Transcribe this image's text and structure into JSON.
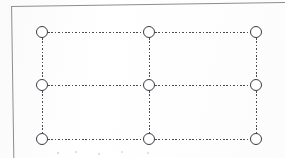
{
  "figure": {
    "kind": "lattice-diagram",
    "background_color": "#ffffff",
    "node_stroke_color": "#3b3b44",
    "node_fill_color": "#ffffff",
    "edge_color": "#4a4a52",
    "frame_color": "#8d8d8f",
    "edge_style": "dashed",
    "node_diameter_px": 12,
    "rows": 3,
    "columns": 3
  },
  "frame": {
    "name": "page-border",
    "top_rule_visible": "true",
    "left_rule_visible": "true",
    "right_rule_visible": "false",
    "bottom_rule_visible": "false",
    "skew_degrees": "-0.85"
  },
  "nodes": [
    {
      "id": "n-r1c1",
      "row": 1,
      "col": 1,
      "x": 42,
      "y": 32,
      "label": ""
    },
    {
      "id": "n-r1c2",
      "row": 1,
      "col": 2,
      "x": 149,
      "y": 32,
      "label": ""
    },
    {
      "id": "n-r1c3",
      "row": 1,
      "col": 3,
      "x": 256,
      "y": 32,
      "label": ""
    },
    {
      "id": "n-r2c1",
      "row": 2,
      "col": 1,
      "x": 42,
      "y": 85,
      "label": ""
    },
    {
      "id": "n-r2c2",
      "row": 2,
      "col": 2,
      "x": 149,
      "y": 85,
      "label": ""
    },
    {
      "id": "n-r2c3",
      "row": 2,
      "col": 3,
      "x": 256,
      "y": 85,
      "label": ""
    },
    {
      "id": "n-r3c1",
      "row": 3,
      "col": 1,
      "x": 42,
      "y": 139,
      "label": ""
    },
    {
      "id": "n-r3c2",
      "row": 3,
      "col": 2,
      "x": 149,
      "y": 139,
      "label": ""
    },
    {
      "id": "n-r3c3",
      "row": 3,
      "col": 3,
      "x": 256,
      "y": 139,
      "label": ""
    }
  ],
  "edges": [
    {
      "id": "e-r1c1-r1c2",
      "orientation": "horizontal",
      "from": "n-r1c1",
      "to": "n-r1c2",
      "x": 48,
      "y": 32,
      "length": 95
    },
    {
      "id": "e-r1c2-r1c3",
      "orientation": "horizontal",
      "from": "n-r1c2",
      "to": "n-r1c3",
      "x": 155,
      "y": 32,
      "length": 95
    },
    {
      "id": "e-r2c1-r2c2",
      "orientation": "horizontal",
      "from": "n-r2c1",
      "to": "n-r2c2",
      "x": 48,
      "y": 85,
      "length": 95
    },
    {
      "id": "e-r2c2-r2c3",
      "orientation": "horizontal",
      "from": "n-r2c2",
      "to": "n-r2c3",
      "x": 155,
      "y": 85,
      "length": 95
    },
    {
      "id": "e-r3c1-r3c2",
      "orientation": "horizontal",
      "from": "n-r3c1",
      "to": "n-r3c2",
      "x": 48,
      "y": 139,
      "length": 95
    },
    {
      "id": "e-r3c2-r3c3",
      "orientation": "horizontal",
      "from": "n-r3c2",
      "to": "n-r3c3",
      "x": 155,
      "y": 139,
      "length": 95
    },
    {
      "id": "e-r1c1-r2c1",
      "orientation": "vertical",
      "from": "n-r1c1",
      "to": "n-r2c1",
      "x": 42,
      "y": 38,
      "length": 41
    },
    {
      "id": "e-r2c1-r3c1",
      "orientation": "vertical",
      "from": "n-r2c1",
      "to": "n-r3c1",
      "x": 42,
      "y": 91,
      "length": 42
    },
    {
      "id": "e-r1c2-r2c2",
      "orientation": "vertical",
      "from": "n-r1c2",
      "to": "n-r2c2",
      "x": 149,
      "y": 38,
      "length": 41
    },
    {
      "id": "e-r2c2-r3c2",
      "orientation": "vertical",
      "from": "n-r2c2",
      "to": "n-r3c2",
      "x": 149,
      "y": 91,
      "length": 42
    },
    {
      "id": "e-r1c3-r2c3",
      "orientation": "vertical",
      "from": "n-r1c3",
      "to": "n-r2c3",
      "x": 256,
      "y": 38,
      "length": 41
    },
    {
      "id": "e-r2c3-r3c3",
      "orientation": "vertical",
      "from": "n-r2c3",
      "to": "n-r3c3",
      "x": 256,
      "y": 91,
      "length": 42
    }
  ]
}
